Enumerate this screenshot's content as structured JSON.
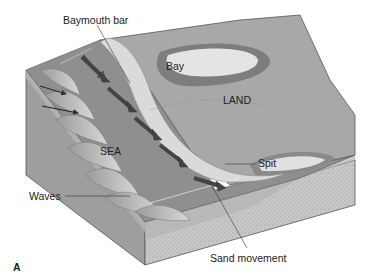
{
  "diagram": {
    "type": "block-diagram",
    "panel_label": "A",
    "labels": {
      "baymouth_bar": "Baymouth bar",
      "bay": "Bay",
      "land": "LAND",
      "sea": "SEA",
      "spit": "Spit",
      "waves": "Waves",
      "sand_movement": "Sand movement"
    },
    "colors": {
      "background": "#ffffff",
      "land_surface": "#a9a9a9",
      "sea_surface": "#8d8d8d",
      "sand_bar": "#d9d9d9",
      "bay_water": "#e6e6e6",
      "block_side_water": "#b8b8b8",
      "block_side_sediment": "#c4c4c4",
      "arrow": "#555555",
      "text": "#222222"
    }
  }
}
